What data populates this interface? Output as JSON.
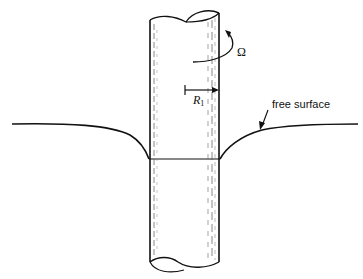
{
  "figure": {
    "type": "diagram",
    "labels": {
      "omega": "Ω",
      "radius_symbol": "R",
      "radius_subscript": "1",
      "free_surface": "free surface"
    },
    "colors": {
      "ink": "#111111",
      "background": "#ffffff"
    }
  }
}
